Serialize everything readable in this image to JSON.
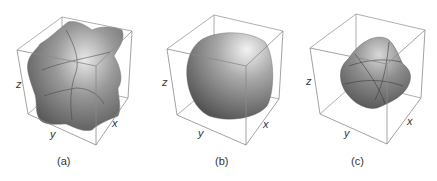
{
  "figure": {
    "panels": [
      {
        "id": "a",
        "caption": "(a)",
        "shape": "cubic star-like surface with six lobes",
        "axes": {
          "x": "x",
          "y": "y",
          "z": "z"
        }
      },
      {
        "id": "b",
        "caption": "(b)",
        "shape": "rounded cube / near-sphere surface",
        "axes": {
          "x": "x",
          "y": "y",
          "z": "z"
        }
      },
      {
        "id": "c",
        "caption": "(c)",
        "shape": "irregular rounded tetrahedral-like surface",
        "axes": {
          "x": "x",
          "y": "y",
          "z": "z"
        }
      }
    ]
  }
}
